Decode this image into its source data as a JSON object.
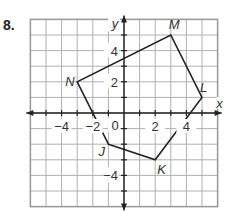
{
  "problem": {
    "number": "8."
  },
  "graph": {
    "x_axis_label": "x",
    "y_axis_label": "y",
    "origin_label": "0",
    "x_tick_labels": [
      {
        "value": -4,
        "label": "−4"
      },
      {
        "value": -2,
        "label": "−2"
      },
      {
        "value": 2,
        "label": "2"
      },
      {
        "value": 4,
        "label": "4"
      }
    ],
    "y_tick_labels": [
      {
        "value": 4,
        "label": "4"
      },
      {
        "value": 2,
        "label": "2"
      },
      {
        "value": -4,
        "label": "−4"
      }
    ],
    "range": {
      "xmin": -6,
      "xmax": 6,
      "ymin": -6,
      "ymax": 6
    },
    "colors": {
      "grid": "#b0b0b0",
      "axes": "#222222",
      "polygon": "#222222",
      "border": "#999999"
    }
  },
  "polygon": {
    "name": "JKLMN",
    "vertices": [
      {
        "label": "J",
        "x": -1,
        "y": -2
      },
      {
        "label": "K",
        "x": 2,
        "y": -3
      },
      {
        "label": "L",
        "x": 5,
        "y": 1
      },
      {
        "label": "M",
        "x": 3,
        "y": 5
      },
      {
        "label": "N",
        "x": -3,
        "y": 2
      }
    ]
  },
  "chart_data": {
    "type": "scatter",
    "title": "",
    "xlabel": "x",
    "ylabel": "y",
    "xlim": [
      -6,
      6
    ],
    "ylim": [
      -6,
      6
    ],
    "grid": true,
    "series": [
      {
        "name": "Pentagon JKLMN",
        "points": [
          {
            "label": "J",
            "x": -1,
            "y": -2
          },
          {
            "label": "K",
            "x": 2,
            "y": -3
          },
          {
            "label": "L",
            "x": 5,
            "y": 1
          },
          {
            "label": "M",
            "x": 3,
            "y": 5
          },
          {
            "label": "N",
            "x": -3,
            "y": 2
          }
        ],
        "closed": true
      }
    ],
    "x_ticks": [
      -4,
      -2,
      0,
      2,
      4
    ],
    "y_ticks": [
      -4,
      2,
      4
    ]
  }
}
